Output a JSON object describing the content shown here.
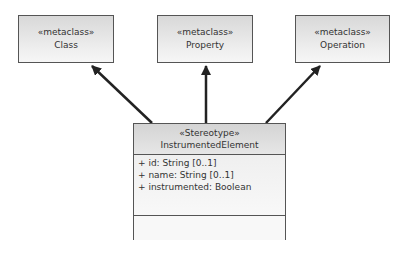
{
  "metaclasses": [
    {
      "stereotype": "«metaclass»",
      "name": "Class"
    },
    {
      "stereotype": "«metaclass»",
      "name": "Property"
    },
    {
      "stereotype": "«metaclass»",
      "name": "Operation"
    }
  ],
  "stereotype_class": {
    "stereotype": "«Stereotype»",
    "name": "InstrumentedElement",
    "attributes": [
      "+ id: String [0..1]",
      "+ name: String [0..1]",
      "+ instrumented: Boolean"
    ],
    "operations": []
  },
  "relations": [
    {
      "from": "InstrumentedElement",
      "to": "Class",
      "type": "extension"
    },
    {
      "from": "InstrumentedElement",
      "to": "Property",
      "type": "extension"
    },
    {
      "from": "InstrumentedElement",
      "to": "Operation",
      "type": "extension"
    }
  ]
}
